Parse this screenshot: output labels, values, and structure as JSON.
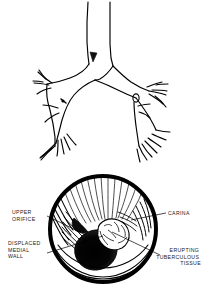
{
  "figure": {
    "background_color": "#ffffff",
    "ink_color": "#000000"
  },
  "upper_panel": {
    "name": "bronchial-tree-diagram",
    "description": "Line drawing of trachea dividing at the carina into left and right main bronchi with lobar and segmental branches",
    "markers": [
      {
        "name": "carina-arrowhead-marker",
        "shape": "filled-arrowhead",
        "x": 93,
        "y": 57
      },
      {
        "name": "left-bronchus-lesion-marker",
        "shape": "small-filled-mark",
        "x": 63,
        "y": 101
      },
      {
        "name": "right-bronchus-ring-marker",
        "shape": "small-open-ring",
        "x": 136,
        "y": 98
      }
    ]
  },
  "lower_panel": {
    "name": "bronchoscopic-view",
    "circle": {
      "cx": 103,
      "cy": 229,
      "r": 55,
      "border_width": 4
    },
    "labels": [
      {
        "id": "upper-orifice",
        "lines": [
          "UPPER",
          "ORIFICE"
        ],
        "align": "left",
        "x": 12,
        "y": 214,
        "leader": {
          "x1": 47,
          "y1": 216,
          "x2": 86,
          "y2": 235
        }
      },
      {
        "id": "carina",
        "lines": [
          "CARINA"
        ],
        "align": "left",
        "x": 168,
        "y": 215,
        "leader": {
          "x1": 166,
          "y1": 213,
          "x2": 131,
          "y2": 220
        }
      },
      {
        "id": "displaced-medial-wall",
        "lines": [
          "DISPLACED",
          "MEDIAL",
          "WALL"
        ],
        "align": "left",
        "x": 8,
        "y": 245,
        "leader": {
          "x1": 47,
          "y1": 253,
          "x2": 103,
          "y2": 236
        }
      },
      {
        "id": "erupting-tuberculous-tissue",
        "lines": [
          "ERUPTING",
          "TUBERCULOUS",
          "TISSUE"
        ],
        "align": "right",
        "x": 201,
        "y": 252,
        "leader": {
          "x1": 160,
          "y1": 255,
          "x2": 112,
          "y2": 232
        }
      }
    ]
  }
}
